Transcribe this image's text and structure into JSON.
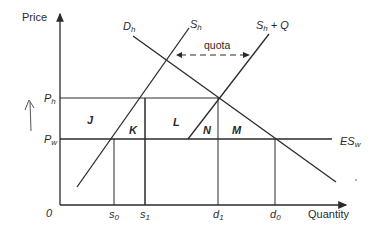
{
  "diagram": {
    "type": "economics-import-quota",
    "axes": {
      "y_label": "Price",
      "x_label": "Quantity",
      "origin_label": "0"
    },
    "price_levels": [
      {
        "id": "Ph",
        "main": "P",
        "sub": "h"
      },
      {
        "id": "Pw",
        "main": "P",
        "sub": "w"
      }
    ],
    "quantity_ticks": [
      {
        "id": "s0",
        "main": "s",
        "sub": "0"
      },
      {
        "id": "s1",
        "main": "s",
        "sub": "1"
      },
      {
        "id": "d1",
        "main": "d",
        "sub": "1"
      },
      {
        "id": "d0",
        "main": "d",
        "sub": "0"
      }
    ],
    "curves": {
      "demand": {
        "main": "D",
        "sub": "h"
      },
      "supply": {
        "main": "S",
        "sub": "h"
      },
      "supply_plus_quota": {
        "main": "S",
        "sub": "h",
        "suffix": " + Q"
      },
      "world_supply": {
        "main": "ES",
        "sub": "w"
      }
    },
    "annotation": {
      "quota_label": "quota"
    },
    "areas": [
      "J",
      "K",
      "L",
      "N",
      "M"
    ],
    "colors": {
      "line": "#2a2a2a",
      "background": "#ffffff"
    }
  }
}
